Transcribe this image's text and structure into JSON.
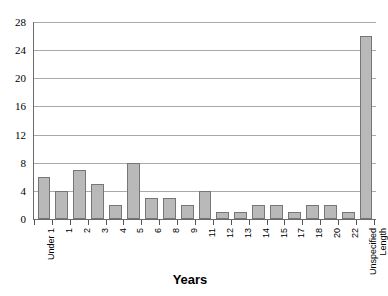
{
  "chart_data": {
    "type": "bar",
    "title": "",
    "xlabel": "Years",
    "ylabel": "",
    "ylim": [
      0,
      28
    ],
    "ytick_step": 4,
    "yticks": [
      0,
      4,
      8,
      12,
      16,
      20,
      24,
      28
    ],
    "grid": true,
    "legend": "none",
    "categories": [
      "Under 1",
      "1",
      "2",
      "3",
      "4",
      "5",
      "6",
      "8",
      "9",
      "11",
      "12",
      "13",
      "14",
      "15",
      "17",
      "18",
      "20",
      "22",
      "Unspecified Length"
    ],
    "values": [
      6,
      4,
      7,
      5,
      2,
      8,
      3,
      3,
      2,
      4,
      1,
      1,
      2,
      2,
      1,
      2,
      2,
      1,
      26
    ],
    "bar_fill_color": "#b9b9b9",
    "bar_border_color": "#767676",
    "gridline_color": "#a9a9a9",
    "axis_color": "#6b6b6b",
    "background_color": "#ffffff"
  },
  "axis": {
    "x_title": "Years"
  }
}
